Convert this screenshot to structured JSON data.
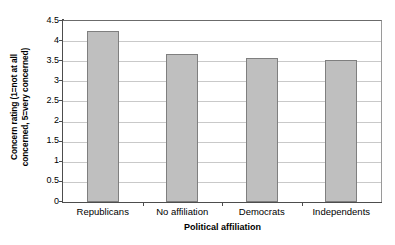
{
  "chart_data": {
    "type": "bar",
    "title": "",
    "categories": [
      "Republicans",
      "No affiliation",
      "Democrats",
      "Independents"
    ],
    "values": [
      4.25,
      3.67,
      3.57,
      3.52
    ],
    "xlabel": "Political affiliation",
    "ylabel_line1": "Concern rating (1=not at all",
    "ylabel_line2": "concerned, 5=very concerned)",
    "ylabel": "Concern rating (1=not at all concerned, 5=very concerned)",
    "ylim": [
      0,
      4.5
    ],
    "yticks": [
      "0",
      "0.5",
      "1",
      "1.5",
      "2",
      "2.5",
      "3",
      "3.5",
      "4",
      "4.5"
    ],
    "ytick_values": [
      0,
      0.5,
      1,
      1.5,
      2,
      2.5,
      3,
      3.5,
      4,
      4.5
    ],
    "grid": true,
    "legend": "none",
    "bar_fill_color": "#bfbfbf",
    "bar_border_color": "#7f7f7f",
    "gridline_color": "#c9c9c9",
    "axis_color": "#4d4d4d",
    "background_color": "#ffffff"
  }
}
